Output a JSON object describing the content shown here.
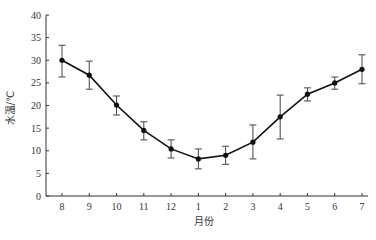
{
  "chart_data": {
    "type": "line",
    "title": "",
    "xlabel": "月份",
    "ylabel": "水温/℃",
    "categories": [
      "8",
      "9",
      "10",
      "11",
      "12",
      "1",
      "2",
      "3",
      "4",
      "5",
      "6",
      "7"
    ],
    "series": [
      {
        "name": "水温",
        "values": [
          30.0,
          26.7,
          20.1,
          14.5,
          10.4,
          8.2,
          9.0,
          11.9,
          17.5,
          22.5,
          25.0,
          28.0
        ],
        "error_upper": [
          33.3,
          29.8,
          22.1,
          16.4,
          12.4,
          10.4,
          11.0,
          15.7,
          22.3,
          23.9,
          26.3,
          31.2
        ],
        "error_lower": [
          26.3,
          23.6,
          17.9,
          12.4,
          8.4,
          6.0,
          7.0,
          8.2,
          12.6,
          21.0,
          23.6,
          24.8
        ]
      }
    ],
    "ylim": [
      0,
      40
    ],
    "yticks": [
      0,
      5,
      10,
      15,
      20,
      25,
      30,
      35,
      40
    ],
    "grid": false,
    "legend": "none",
    "marker": "filled-circle",
    "color": "#111111"
  }
}
